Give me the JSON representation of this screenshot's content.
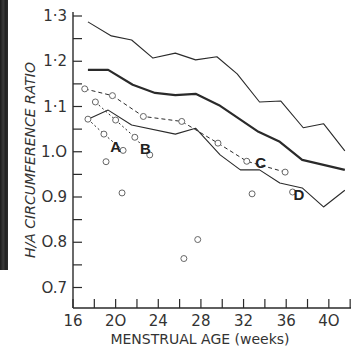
{
  "chart_data": {
    "type": "line",
    "title": "",
    "xlabel": "MENSTRUAL AGE (weeks)",
    "ylabel": "H/A CIRCUMFERENCE RATIO",
    "xlim": [
      16,
      42
    ],
    "ylim": [
      0.66,
      1.3
    ],
    "x_ticks": [
      16,
      20,
      24,
      28,
      32,
      36,
      40
    ],
    "x_minor_step": 2,
    "y_ticks": [
      0.7,
      0.8,
      0.9,
      1.0,
      1.1,
      1.2,
      1.3
    ],
    "y_tick_labels": [
      "O.7",
      "O.8",
      "O.9",
      "1.O",
      "1·1",
      "1·2",
      "1·3"
    ],
    "x_tick_labels": [
      "16",
      "2O",
      "24",
      "28",
      "32",
      "36",
      "4O"
    ],
    "grid": false,
    "legend": null,
    "series": [
      {
        "name": "upper normal limit",
        "style": "thin-solid",
        "x": [
          17.4,
          19.6,
          21.5,
          23.5,
          25.6,
          27.5,
          29.5,
          31.4,
          33.5,
          35.5,
          37.6,
          39.5,
          41.5
        ],
        "values": [
          1.287,
          1.256,
          1.247,
          1.207,
          1.218,
          1.203,
          1.21,
          1.172,
          1.11,
          1.112,
          1.053,
          1.062,
          1.002
        ]
      },
      {
        "name": "mean",
        "style": "thick-solid",
        "x": [
          17.4,
          19.3,
          21.6,
          23.7,
          25.6,
          27.5,
          29.7,
          33.4,
          35.4,
          37.5,
          41.5
        ],
        "values": [
          1.181,
          1.181,
          1.148,
          1.13,
          1.125,
          1.128,
          1.103,
          1.044,
          1.022,
          0.982,
          0.96
        ]
      },
      {
        "name": "lower normal limit",
        "style": "thin-solid",
        "x": [
          17.4,
          19.3,
          21.5,
          25.6,
          27.5,
          29.8,
          31.7,
          33.5,
          35.4,
          37.5,
          39.5,
          41.5
        ],
        "values": [
          1.072,
          1.092,
          1.059,
          1.039,
          1.052,
          0.993,
          0.96,
          0.96,
          0.931,
          0.92,
          0.878,
          0.915
        ]
      },
      {
        "name": "patient C",
        "style": "dashed-with-circles",
        "label": "C",
        "x": [
          17.1,
          19.7,
          22.6,
          26.2,
          29.6,
          32.3,
          35.9
        ],
        "values": [
          1.139,
          1.124,
          1.078,
          1.067,
          1.019,
          0.979,
          0.955
        ]
      },
      {
        "name": "patient A",
        "style": "dotted-with-circles",
        "label": "A",
        "x": [
          17.4,
          18.9,
          20.7
        ],
        "values": [
          1.072,
          1.039,
          1.003
        ]
      },
      {
        "name": "patient B",
        "style": "dotted-with-circles",
        "label": "B",
        "x": [
          18.1,
          20.0,
          21.8,
          23.2
        ],
        "values": [
          1.11,
          1.07,
          1.032,
          0.993
        ]
      }
    ],
    "scatter_points": [
      {
        "x": 19.1,
        "y": 0.978
      },
      {
        "x": 20.6,
        "y": 0.909
      },
      {
        "x": 27.7,
        "y": 0.806
      },
      {
        "x": 26.4,
        "y": 0.764
      },
      {
        "x": 32.8,
        "y": 0.907
      },
      {
        "x": 36.6,
        "y": 0.911,
        "label": "D"
      }
    ],
    "annotations": [
      {
        "text": "A",
        "x": 20.0,
        "y": 1.01
      },
      {
        "text": "B",
        "x": 22.8,
        "y": 1.005
      },
      {
        "text": "C",
        "x": 33.6,
        "y": 0.975
      },
      {
        "text": "D",
        "x": 37.2,
        "y": 0.905
      }
    ]
  },
  "labels": {
    "xlabel": "MENSTRUAL AGE (weeks)",
    "ylabel": "H/A CIRCUMFERENCE RATIO"
  },
  "colors": {
    "line": "#2a2a2a",
    "circle": "#666666",
    "text": "#333333",
    "background": "#ffffff"
  }
}
